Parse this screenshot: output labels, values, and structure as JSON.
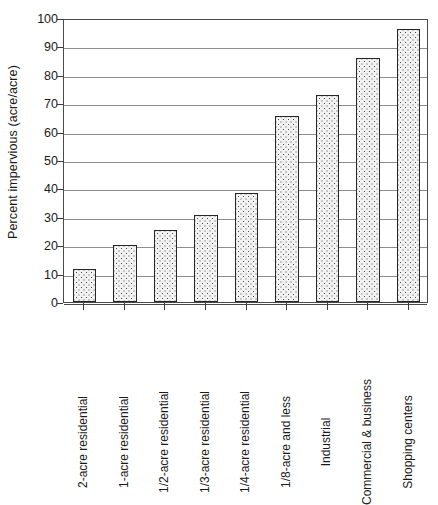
{
  "chart_data": {
    "type": "bar",
    "title": "",
    "subtitle": "",
    "xlabel": "",
    "ylabel": "Percent impervious (acre/acre)",
    "ylim": [
      0,
      100
    ],
    "ytick_step": 10,
    "yticks": [
      0,
      10,
      20,
      30,
      40,
      50,
      60,
      70,
      80,
      90,
      100
    ],
    "ytick_labels": [
      "0",
      "10",
      "20",
      "30",
      "40",
      "50",
      "60",
      "70",
      "80",
      "90",
      "100"
    ],
    "grid": "horizontal",
    "legend": "none",
    "annotations": [],
    "categories": [
      "2-acre residential",
      "1-acre residential",
      "1/2-acre residential",
      "1/3-acre residential",
      "1/4-acre residential",
      "1/8-acre and less",
      "Industrial",
      "Commercial & business",
      "Shopping centers"
    ],
    "values": [
      11.5,
      20,
      25.5,
      30.5,
      38.5,
      65.5,
      73,
      86,
      96
    ],
    "bar_fill_pattern": "dotted-stipple",
    "bar_fill_color": "#f2f2f2",
    "bar_dot_color": "#4a4a4a",
    "bar_border_color": "#262626",
    "gridline_color": "#8c8c8c",
    "axis_color": "#4a4a4a",
    "background_color": "#ffffff"
  }
}
